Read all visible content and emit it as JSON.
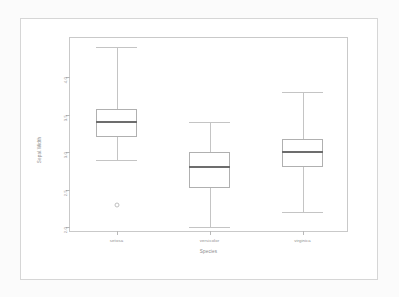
{
  "figure": {
    "background_color": "#ffffff",
    "page_background_color": "#fbfbfb",
    "frame_color": "#d6d6d6",
    "panel_border_color": "#c9c9c9"
  },
  "axes": {
    "y_title": "Sepal.Width",
    "x_title": "Species",
    "y_tick_labels": [
      "2.0",
      "2.5",
      "3.0",
      "3.5",
      "4.0"
    ],
    "y_tick_values": [
      2.0,
      2.5,
      3.0,
      3.5,
      4.0
    ],
    "x_tick_labels": [
      "setosa",
      "versicolor",
      "virginica"
    ]
  },
  "chart_data": {
    "type": "box",
    "title": "",
    "xlabel": "Species",
    "ylabel": "Sepal.Width",
    "categories": [
      "setosa",
      "versicolor",
      "virginica"
    ],
    "ylim": [
      1.92,
      4.52
    ],
    "yticks": [
      2.0,
      2.5,
      3.0,
      3.5,
      4.0
    ],
    "grid": false,
    "legend": "none",
    "boxes": [
      {
        "category": "setosa",
        "whisker_low": 2.9,
        "q1": 3.2,
        "median": 3.4,
        "q3": 3.575,
        "whisker_high": 4.4,
        "outliers": [
          2.3
        ]
      },
      {
        "category": "versicolor",
        "whisker_low": 2.0,
        "q1": 2.525,
        "median": 2.8,
        "q3": 3.0,
        "whisker_high": 3.4,
        "outliers": []
      },
      {
        "category": "virginica",
        "whisker_low": 2.2,
        "q1": 2.8,
        "median": 3.0,
        "q3": 3.175,
        "whisker_high": 3.8,
        "outliers": []
      }
    ],
    "box_fill_color": "#ffffff",
    "box_line_color": "#b0b0b0",
    "median_line_color": "#6d6d6d",
    "whisker_color": "#c4c4c4",
    "outlier_color": "#c0c0c0"
  }
}
